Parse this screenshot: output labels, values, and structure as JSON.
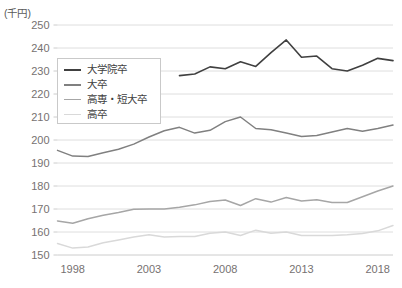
{
  "chart_data": {
    "type": "line",
    "title": "",
    "subtitle": "",
    "unit_label": "(千円)",
    "xlabel": "",
    "ylabel": "",
    "ylim": [
      150,
      250
    ],
    "ytick_values": [
      150,
      160,
      170,
      180,
      190,
      200,
      210,
      220,
      230,
      240,
      250
    ],
    "ytick_labels": [
      "150",
      "160",
      "170",
      "180",
      "190",
      "200",
      "210",
      "220",
      "230",
      "240",
      "250"
    ],
    "xlim": [
      1997,
      2019
    ],
    "xtick_values": [
      1998,
      2003,
      2008,
      2013,
      2018
    ],
    "xtick_labels": [
      "1998",
      "2003",
      "2008",
      "2013",
      "2018"
    ],
    "grid": true,
    "legend_position": "upper-left-inside",
    "x": [
      1997,
      1998,
      1999,
      2000,
      2001,
      2002,
      2003,
      2004,
      2005,
      2006,
      2007,
      2008,
      2009,
      2010,
      2011,
      2012,
      2013,
      2014,
      2015,
      2016,
      2017,
      2018,
      2019
    ],
    "series": [
      {
        "name": "大学院卒",
        "color": "#404040",
        "width": 1.6,
        "x": [
          2005,
          2006,
          2007,
          2008,
          2009,
          2010,
          2011,
          2012,
          2013,
          2014,
          2015,
          2016,
          2017,
          2018,
          2019
        ],
        "values": [
          228.0,
          228.7,
          231.8,
          231.0,
          234.0,
          232.0,
          238.0,
          243.5,
          236.0,
          236.5,
          231.0,
          230.0,
          232.5,
          235.5,
          234.5
        ]
      },
      {
        "name": "大卒",
        "color": "#808080",
        "width": 1.5,
        "x": [
          1997,
          1998,
          1999,
          2000,
          2001,
          2002,
          2003,
          2004,
          2005,
          2006,
          2007,
          2008,
          2009,
          2010,
          2011,
          2012,
          2013,
          2014,
          2015,
          2016,
          2017,
          2018,
          2019
        ],
        "values": [
          195.5,
          193.0,
          192.8,
          194.5,
          196.0,
          198.2,
          201.3,
          204.0,
          205.5,
          203.0,
          204.2,
          208.0,
          210.0,
          205.0,
          204.5,
          203.0,
          201.5,
          202.0,
          203.5,
          205.0,
          203.8,
          205.0,
          206.5
        ]
      },
      {
        "name": "高専・短大卒",
        "color": "#a6a6a6",
        "width": 1.5,
        "x": [
          1997,
          1998,
          1999,
          2000,
          2001,
          2002,
          2003,
          2004,
          2005,
          2006,
          2007,
          2008,
          2009,
          2010,
          2011,
          2012,
          2013,
          2014,
          2015,
          2016,
          2017,
          2018,
          2019
        ],
        "values": [
          164.8,
          163.8,
          165.8,
          167.3,
          168.5,
          169.9,
          170.0,
          170.0,
          170.8,
          171.8,
          173.3,
          173.9,
          171.5,
          174.5,
          173.0,
          175.0,
          173.5,
          174.0,
          172.8,
          172.8,
          175.3,
          177.8,
          180.0
        ]
      },
      {
        "name": "高卒",
        "color": "#d9d9d9",
        "width": 1.5,
        "x": [
          1997,
          1998,
          1999,
          2000,
          2001,
          2002,
          2003,
          2004,
          2005,
          2006,
          2007,
          2008,
          2009,
          2010,
          2011,
          2012,
          2013,
          2014,
          2015,
          2016,
          2017,
          2018,
          2019
        ],
        "values": [
          155.0,
          153.0,
          153.5,
          155.3,
          156.5,
          157.8,
          158.8,
          157.8,
          158.0,
          158.0,
          159.5,
          160.0,
          158.5,
          160.8,
          159.5,
          160.0,
          158.5,
          158.5,
          158.5,
          158.8,
          159.3,
          160.5,
          162.8
        ]
      }
    ]
  },
  "legend": {
    "items": [
      {
        "label": "大学院卒",
        "color": "#404040",
        "width": 2.4
      },
      {
        "label": "大卒",
        "color": "#808080",
        "width": 2.2
      },
      {
        "label": "高専・短大卒",
        "color": "#a6a6a6",
        "width": 1.8
      },
      {
        "label": "高卒",
        "color": "#d9d9d9",
        "width": 1.8
      }
    ]
  }
}
